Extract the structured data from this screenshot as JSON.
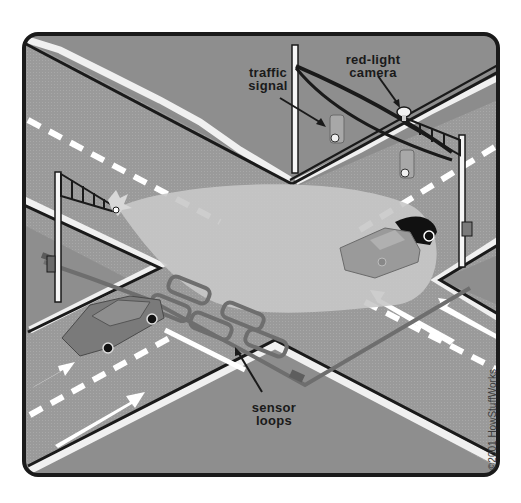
{
  "diagram": {
    "labels": {
      "traffic_signal": [
        "traffic",
        "signal"
      ],
      "red_light_camera": [
        "red-light",
        "camera"
      ],
      "sensor_loops": [
        "sensor",
        "loops"
      ]
    },
    "credit": "©2001 HowStuffWorks",
    "colors": {
      "background": "#ffffff",
      "frame": "#1a1a1a",
      "road": "#9c9c9c",
      "corner_ground": "#8a8a8a",
      "curb": "#f2f2f2",
      "lane_marking": "#ffffff",
      "flash_beam": "#c9c9c9",
      "sensor_loop": "#7a7a7a",
      "pole": "#f5f5f5",
      "car_fill": "#8e8e8e",
      "car_shadow": "#111111"
    },
    "components": [
      {
        "id": "traffic-signal",
        "label": "traffic signal"
      },
      {
        "id": "red-light-camera",
        "label": "red-light camera"
      },
      {
        "id": "sensor-loops",
        "label": "sensor loops"
      },
      {
        "id": "flash-unit",
        "label": "camera flash"
      },
      {
        "id": "car-in-intersection",
        "label": "car running red light"
      },
      {
        "id": "car-approaching",
        "label": "approaching car"
      }
    ]
  }
}
